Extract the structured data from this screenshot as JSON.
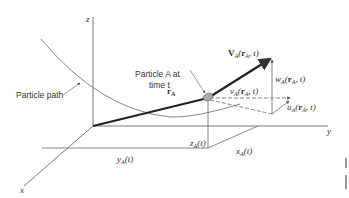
{
  "figure": {
    "axes": {
      "z_label": "z",
      "y_label": "y",
      "x_label": "x"
    },
    "labels": {
      "particle_path": "Particle path",
      "particle_line1": "Particle A at",
      "particle_line2": "time t",
      "r": "r",
      "r_sub": "A",
      "V": "V",
      "V_sub": "A",
      "V_args": "(r",
      "V_args_sub": "A",
      "V_tail": ", t)",
      "w": "w",
      "w_sub": "A",
      "v": "v",
      "v_sub": "A",
      "u": "u",
      "u_sub": "A",
      "z_coord": "z",
      "x_coord": "x",
      "y_coord": "y",
      "coord_sub": "A",
      "coord_tail": "(t)"
    },
    "colors": {
      "line": "#333333",
      "path": "#888888",
      "particle_fill": "#aaaaaa"
    }
  }
}
